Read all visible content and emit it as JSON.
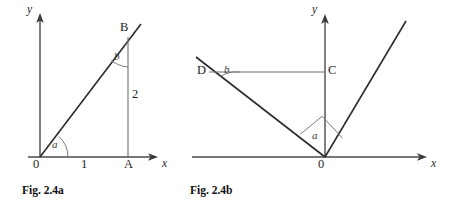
{
  "figure_set": {
    "background_color": "#ffffff",
    "line_color": "#2b2b2b",
    "thin_line_color": "#6f6f6f"
  },
  "figure_a": {
    "caption": "Fig. 2.4a",
    "axis_x_label": "x",
    "axis_y_label": "y",
    "origin_label": "0",
    "tick_label_1": "1",
    "point_A": "A",
    "point_B": "B",
    "segment_length_label": "2",
    "angle_at_origin": "a",
    "angle_at_B": "b",
    "geometry": {
      "origin": [
        40,
        157
      ],
      "x_axis_end": [
        156,
        157
      ],
      "y_axis_end": [
        40,
        16
      ],
      "point_A": [
        128,
        157
      ],
      "point_B": [
        128,
        36
      ],
      "ray_end": [
        140,
        25
      ],
      "tick_1_x": 84
    }
  },
  "figure_b": {
    "caption": "Fig. 2.4b",
    "axis_x_label": "x",
    "axis_y_label": "y",
    "origin_label": "0",
    "point_C": "C",
    "point_D": "D",
    "angle_at_origin": "a",
    "angle_at_D": "b",
    "right_angle_marker": true,
    "geometry": {
      "origin": [
        325,
        157
      ],
      "x_axis_start": [
        192,
        157
      ],
      "x_axis_end": [
        425,
        157
      ],
      "y_axis_end": [
        325,
        16
      ],
      "point_C": [
        325,
        72
      ],
      "point_D": [
        210,
        72
      ],
      "left_ray_end": [
        196,
        57
      ],
      "right_ray_end": [
        405,
        22
      ]
    }
  }
}
